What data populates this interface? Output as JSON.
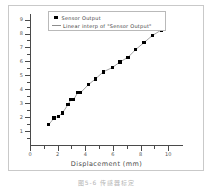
{
  "figure": {
    "caption": "图5-6  传感器标定"
  },
  "legend": {
    "position": "top-center",
    "entries": [
      {
        "label": "Sensor Output",
        "marker": "filled-square",
        "color": "#000000"
      },
      {
        "label": "Linear interp of \"Sensor Output\"",
        "marker": "line",
        "color": "#8c8c8c"
      }
    ]
  },
  "chart_data": {
    "type": "scatter",
    "title": "",
    "xlabel": "Displacement (mm)",
    "ylabel": "Sensor Output (mV)",
    "xlim": [
      0,
      11
    ],
    "ylim": [
      0,
      9.4
    ],
    "grid": false,
    "xticks": [
      0,
      2,
      4,
      6,
      8,
      10
    ],
    "xticklabels": [
      "0",
      "2",
      "4",
      "6",
      "8",
      "10"
    ],
    "yticks": [
      1,
      2,
      3,
      4,
      5,
      6,
      7,
      8,
      9
    ],
    "yticklabels": [
      "1",
      "2",
      "3",
      "4",
      "5",
      "6",
      "7",
      "8",
      "9"
    ],
    "series": [
      {
        "name": "Sensor Output",
        "marker": "filled-square",
        "color": "#000000",
        "x": [
          1.35,
          1.75,
          2.05,
          2.35,
          2.75,
          2.95,
          3.15,
          3.45,
          3.65,
          4.25,
          4.75,
          5.3,
          5.95,
          6.5,
          7.1,
          7.65,
          8.25,
          8.85,
          9.5
        ],
        "y": [
          1.45,
          1.95,
          2.05,
          2.3,
          2.9,
          3.25,
          3.25,
          3.75,
          3.75,
          4.35,
          4.75,
          5.25,
          5.55,
          5.95,
          6.3,
          6.85,
          7.35,
          7.85,
          8.25
        ]
      },
      {
        "name": "Linear interp of \"Sensor Output\"",
        "marker": "line",
        "color": "#8c8c8c"
      }
    ]
  }
}
